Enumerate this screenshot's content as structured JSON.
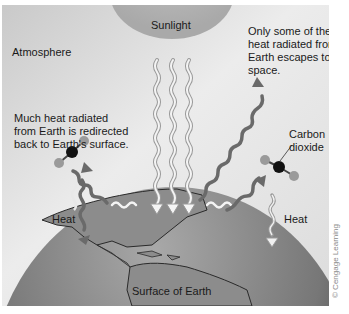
{
  "diagram": {
    "title_hidden": "Greenhouse effect",
    "labels": {
      "sunlight": "Sunlight",
      "atmosphere": "Atmosphere",
      "escapes": [
        "Only some of the",
        "heat radiated from",
        "Earth escapes to",
        "space."
      ],
      "redirected": [
        "Much heat radiated",
        "from Earth is redirected",
        "back to Earth's surface."
      ],
      "co2": [
        "Carbon",
        "dioxide"
      ],
      "heat_left": "Heat",
      "heat_right": "Heat",
      "surface": "Surface of Earth"
    },
    "credit": "© Cengage Learning",
    "colors": {
      "sky_light": "#f0f0f0",
      "sky_dark": "#c8c8c8",
      "sun": "#b4b4b4",
      "earth_light": "#9a9a9a",
      "earth_dark": "#3c3c3c",
      "land": "#8a8a8a",
      "coast": "#2a2a2a",
      "wave_light": "#e8e8e8",
      "wave_dark": "#6e6e6e",
      "carbon": "#111111",
      "oxygen": "#999999"
    }
  }
}
